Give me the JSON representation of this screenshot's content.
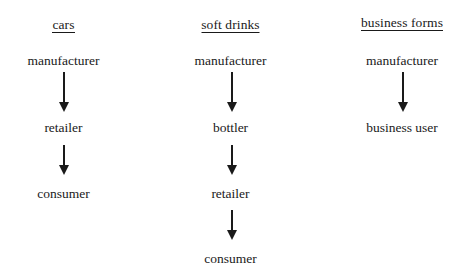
{
  "diagram": {
    "type": "distribution-channel-flow",
    "title": "",
    "background_color": "#ffffff",
    "text_color": "#1a1a1a",
    "columns": [
      {
        "id": "cars",
        "header": "cars",
        "header_underlined": true,
        "nodes": [
          "manufacturer",
          "retailer",
          "consumer"
        ],
        "arrows": [
          {
            "from": "manufacturer",
            "to": "retailer",
            "length": "long"
          },
          {
            "from": "retailer",
            "to": "consumer",
            "length": "short"
          }
        ]
      },
      {
        "id": "soft-drinks",
        "header": "soft drinks",
        "header_underlined": true,
        "nodes": [
          "manufacturer",
          "bottler",
          "retailer",
          "consumer"
        ],
        "arrows": [
          {
            "from": "manufacturer",
            "to": "bottler",
            "length": "long"
          },
          {
            "from": "bottler",
            "to": "retailer",
            "length": "short"
          },
          {
            "from": "retailer",
            "to": "consumer",
            "length": "short"
          }
        ]
      },
      {
        "id": "business-forms",
        "header": "business forms",
        "header_underlined": true,
        "nodes": [
          "manufacturer",
          "business user"
        ],
        "arrows": [
          {
            "from": "manufacturer",
            "to": "business user",
            "length": "long"
          }
        ]
      }
    ]
  }
}
